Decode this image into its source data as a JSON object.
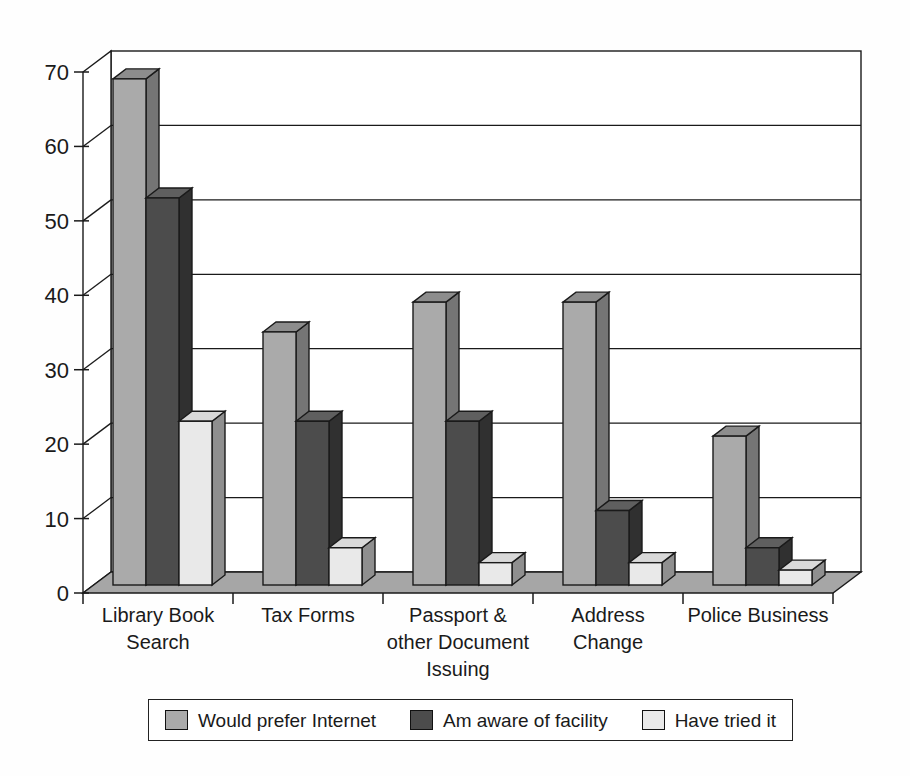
{
  "figure": {
    "title": "",
    "background": "#ffffff"
  },
  "chart_data": {
    "type": "bar",
    "projection": "3d",
    "title": "",
    "xlabel": "",
    "ylabel": "",
    "categories": [
      "Library Book Search",
      "Tax Forms",
      "Passport & other Document Issuing",
      "Address Change",
      "Police Business"
    ],
    "category_label_lines": [
      [
        "Library Book",
        "Search"
      ],
      [
        "Tax Forms"
      ],
      [
        "Passport &",
        "other Document",
        "Issuing"
      ],
      [
        "Address",
        "Change"
      ],
      [
        "Police Business"
      ]
    ],
    "series": [
      {
        "name": "Would prefer Internet",
        "values": [
          68,
          34,
          38,
          38,
          20
        ],
        "color": "#aaaaaa",
        "color_top": "#8d8d8d",
        "color_side": "#757575"
      },
      {
        "name": "Am aware of facility",
        "values": [
          52,
          22,
          22,
          10,
          5
        ],
        "color": "#4c4c4c",
        "color_top": "#5f5f5f",
        "color_side": "#303030"
      },
      {
        "name": "Have tried it",
        "values": [
          22,
          5,
          3,
          3,
          2
        ],
        "color": "#e9e9e9",
        "color_top": "#d9d9d9",
        "color_side": "#8f8f8f"
      }
    ],
    "y_ticks": [
      0,
      10,
      20,
      30,
      40,
      50,
      60,
      70
    ],
    "ylim": [
      0,
      70
    ],
    "grid": true,
    "wall_color": "#ffffff",
    "floor_color": "#a6a6a6",
    "line_color": "#1a1a1a",
    "legend_position": "bottom"
  }
}
